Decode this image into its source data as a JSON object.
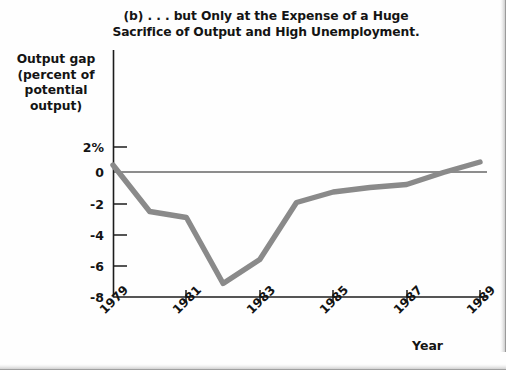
{
  "figure": {
    "title": "(b) . . . but Only at the Expense of a Huge Sacrifice of Output and High Unemployment.",
    "title_line1": "(b) . . . but Only at the Expense of a Huge",
    "title_line2": "Sacrifice of Output and High Unemployment.",
    "y_axis_title": "Output gap (percent of potential output)",
    "y_axis_title_line1": "Output gap",
    "y_axis_title_line2": "(percent of",
    "y_axis_title_line3": "potential",
    "y_axis_title_line4": "output)",
    "x_axis_title": "Year",
    "line_color": "#8a8a8a",
    "axis_color": "#1c1c1c",
    "background_color": "#fefefe"
  },
  "chart_data": {
    "type": "line",
    "title": "(b) . . . but Only at the Expense of a Huge Sacrifice of Output and High Unemployment.",
    "xlabel": "Year",
    "ylabel": "Output gap (percent of potential output)",
    "x": [
      1979,
      1980,
      1981,
      1982,
      1983,
      1984,
      1985,
      1986,
      1987,
      1988,
      1989
    ],
    "values": [
      0.8,
      -2.3,
      -2.7,
      -7.1,
      -5.5,
      -1.7,
      -1.0,
      -0.7,
      -0.5,
      0.3,
      1.0
    ],
    "series": [
      {
        "name": "Output gap",
        "values": [
          0.8,
          -2.3,
          -2.7,
          -7.1,
          -5.5,
          -1.7,
          -1.0,
          -0.7,
          -0.5,
          0.3,
          1.0
        ],
        "color": "#8a8a8a"
      }
    ],
    "xlim": [
      1979,
      1989
    ],
    "ylim": [
      -8,
      2
    ],
    "x_ticks": [
      1979,
      1981,
      1983,
      1985,
      1987,
      1989
    ],
    "x_tick_labels": [
      "1979",
      "1981",
      "1983",
      "1985",
      "1987",
      "1989"
    ],
    "y_ticks": [
      2,
      0,
      -2,
      -4,
      -6,
      -8
    ],
    "y_tick_labels": [
      "2%",
      "0",
      "-2",
      "-4",
      "-6",
      "-8"
    ],
    "grid": false,
    "legend": null,
    "zero_line": true
  },
  "y_ticks": [
    {
      "label": "2%"
    },
    {
      "label": "0"
    },
    {
      "label": "-2"
    },
    {
      "label": "-4"
    },
    {
      "label": "-6"
    },
    {
      "label": "-8"
    }
  ],
  "x_ticks": [
    {
      "label": "1979"
    },
    {
      "label": "1981"
    },
    {
      "label": "1983"
    },
    {
      "label": "1985"
    },
    {
      "label": "1987"
    },
    {
      "label": "1989"
    }
  ]
}
